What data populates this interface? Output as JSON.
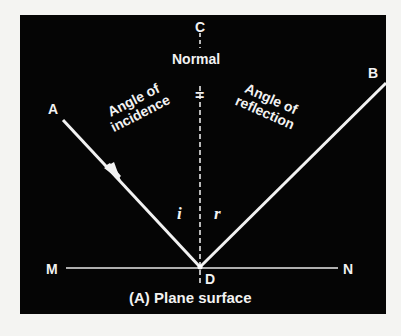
{
  "diagram": {
    "caption": "(A) Plane surface",
    "background_color": "#050505",
    "line_color": "#f2f2f2",
    "points": {
      "A": "A",
      "B": "B",
      "C": "C",
      "D": "D",
      "M": "M",
      "N": "N"
    },
    "normal_label": "Normal",
    "equals_sign": "=",
    "angle_incidence": {
      "line1": "Angle of",
      "line2": "incidence",
      "symbol": "i"
    },
    "angle_reflection": {
      "line1": "Angle of",
      "line2": "reflection",
      "symbol": "r"
    },
    "elements": [
      {
        "type": "line",
        "name": "incident-ray",
        "from": "A",
        "to": "D",
        "arrow": true
      },
      {
        "type": "line",
        "name": "reflected-ray",
        "from": "D",
        "to": "B"
      },
      {
        "type": "dashed-line",
        "name": "normal",
        "from": "C",
        "to": "D"
      },
      {
        "type": "line",
        "name": "surface",
        "from": "M",
        "to": "N"
      }
    ]
  }
}
